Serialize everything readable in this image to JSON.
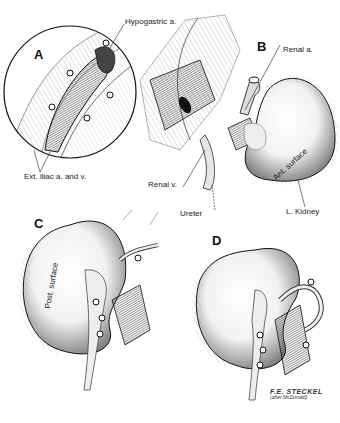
{
  "figure": {
    "panels": [
      {
        "id": "A",
        "letter": "A",
        "labels": {
          "hypogastric": "Hypogastric a.",
          "ext_iliac": "Ext. iliac a. and v."
        }
      },
      {
        "id": "B",
        "letter": "B",
        "labels": {
          "renal_a": "Renal a.",
          "renal_v": "Renal v.",
          "ureter": "Ureter",
          "ant_surface": "Ant. surface",
          "l_kidney": "L. Kidney"
        }
      },
      {
        "id": "C",
        "letter": "C",
        "labels": {
          "post_surface": "Post. surface"
        }
      },
      {
        "id": "D",
        "letter": "D",
        "labels": {}
      }
    ],
    "signature": {
      "name": "F.E. STECKEL",
      "credit": "(after McDonald)"
    },
    "colors": {
      "ink": "#1a1a1a",
      "paper": "#ffffff",
      "shade": "#555555",
      "light_shade": "#bdbdbd"
    }
  }
}
